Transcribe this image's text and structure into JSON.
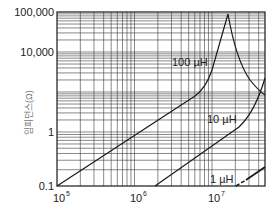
{
  "chart_data": {
    "type": "line",
    "title": "",
    "xlabel": "",
    "ylabel": "임피던스(Ω)",
    "x_scale": "log",
    "y_scale": "log",
    "x_ticks": [
      "10⁵",
      "10⁶",
      "10⁷"
    ],
    "y_ticks": [
      "100,000",
      "10,000",
      "1",
      "0.1"
    ],
    "xlim": [
      100000,
      48000000
    ],
    "ylim": [
      0.1,
      100000
    ],
    "grid": true,
    "legend": "inline labels",
    "series": [
      {
        "name": "100 µH",
        "label": "100 µH",
        "points": [
          [
            100000,
            0.1
          ],
          [
            4000000,
            60
          ],
          [
            6000000,
            600
          ],
          [
            7000000,
            100000
          ],
          [
            10000000,
            2000
          ],
          [
            48000000,
            30
          ]
        ]
      },
      {
        "name": "10 µH",
        "label": "10 µH",
        "points": [
          [
            1300000,
            0.1
          ],
          [
            15000000,
            1.2
          ],
          [
            25000000,
            6
          ],
          [
            48000000,
            200
          ]
        ]
      },
      {
        "name": "1 µH",
        "label": "1 µH",
        "style": "dashed-start",
        "points": [
          [
            15000000,
            0.1
          ],
          [
            48000000,
            0.25
          ]
        ]
      }
    ]
  },
  "axis": {
    "x_labels": [
      "10",
      "10",
      "10"
    ],
    "x_exps": [
      "5",
      "6",
      "7"
    ],
    "y_labels": [
      "100,000",
      "10,000",
      "1",
      "0.1"
    ],
    "y_title": "임피던스(Ω)"
  },
  "labels": {
    "l100": "100 µH",
    "l10": "10 µH",
    "l1": "1 µH"
  },
  "colors": {
    "line": "#1a1a1a",
    "grid": "#3a3a3a",
    "background": "#ffffff"
  }
}
